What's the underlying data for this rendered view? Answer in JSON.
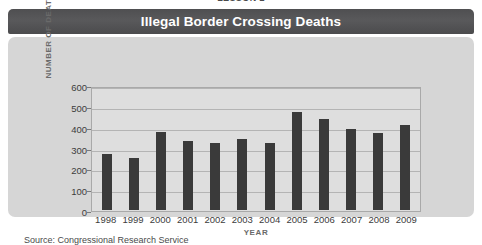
{
  "lesson_header": "LESSON 2",
  "title": "Illegal Border Crossing Deaths",
  "source_note": "Source: Congressional Research Service",
  "colors": {
    "title_bar": "#525254",
    "title_text": "#ffffff",
    "card_background": "#d6d6d6",
    "plot_background": "#dedede",
    "plot_border": "#a9a9a9",
    "gridline": "#b4b4b4",
    "bar": "#3a3a3a",
    "axis_title": "#6a6a6a",
    "tick_text": "#3c3c3c"
  },
  "chart_data": {
    "type": "bar",
    "title": "Illegal Border Crossing Deaths",
    "xlabel": "YEAR",
    "ylabel": "NUMBER OF DEATHS",
    "categories": [
      "1998",
      "1999",
      "2000",
      "2001",
      "2002",
      "2003",
      "2004",
      "2005",
      "2006",
      "2007",
      "2008",
      "2009"
    ],
    "values": [
      275,
      255,
      380,
      335,
      325,
      345,
      325,
      480,
      445,
      395,
      375,
      415
    ],
    "ylim": [
      0,
      600
    ],
    "ytick_values": [
      0,
      100,
      200,
      300,
      400,
      500,
      600
    ],
    "ytick_labels": [
      "0",
      "100",
      "200",
      "300",
      "400",
      "500",
      "600"
    ],
    "grid": true,
    "legend": false,
    "series_name": "Number of Deaths"
  }
}
